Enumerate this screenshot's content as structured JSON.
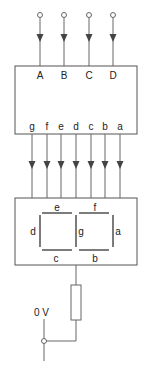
{
  "diagram": {
    "inputs": [
      {
        "label": "A",
        "x": 40
      },
      {
        "label": "B",
        "x": 64
      },
      {
        "label": "C",
        "x": 89
      },
      {
        "label": "D",
        "x": 113
      }
    ],
    "decoder_outputs": [
      {
        "label": "g",
        "x": 32
      },
      {
        "label": "f",
        "x": 47
      },
      {
        "label": "e",
        "x": 61
      },
      {
        "label": "d",
        "x": 76
      },
      {
        "label": "c",
        "x": 91
      },
      {
        "label": "b",
        "x": 105
      },
      {
        "label": "a",
        "x": 120
      }
    ],
    "display_segments": {
      "e": "e",
      "f": "f",
      "d": "d",
      "g": "g",
      "a": "a",
      "c": "c",
      "b": "b"
    },
    "ground_label": "0 V",
    "colors": {
      "line": "#555555",
      "text": "#222222",
      "background": "#ffffff"
    }
  }
}
